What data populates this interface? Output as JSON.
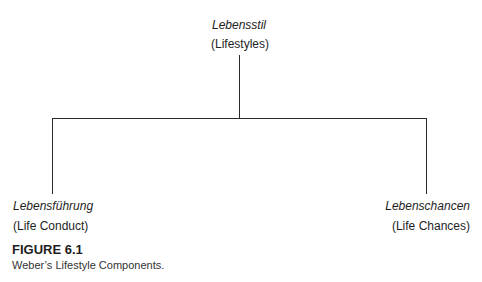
{
  "diagram": {
    "root": {
      "term": "Lebensstil",
      "translation": "(Lifestyles)"
    },
    "children": [
      {
        "term": "Lebensführung",
        "translation": "(Life Conduct)"
      },
      {
        "term": "Lebenschancen",
        "translation": "(Life Chances)"
      }
    ]
  },
  "caption": {
    "label": "FIGURE 6.1",
    "text": "Weber’s Lifestyle Components."
  }
}
